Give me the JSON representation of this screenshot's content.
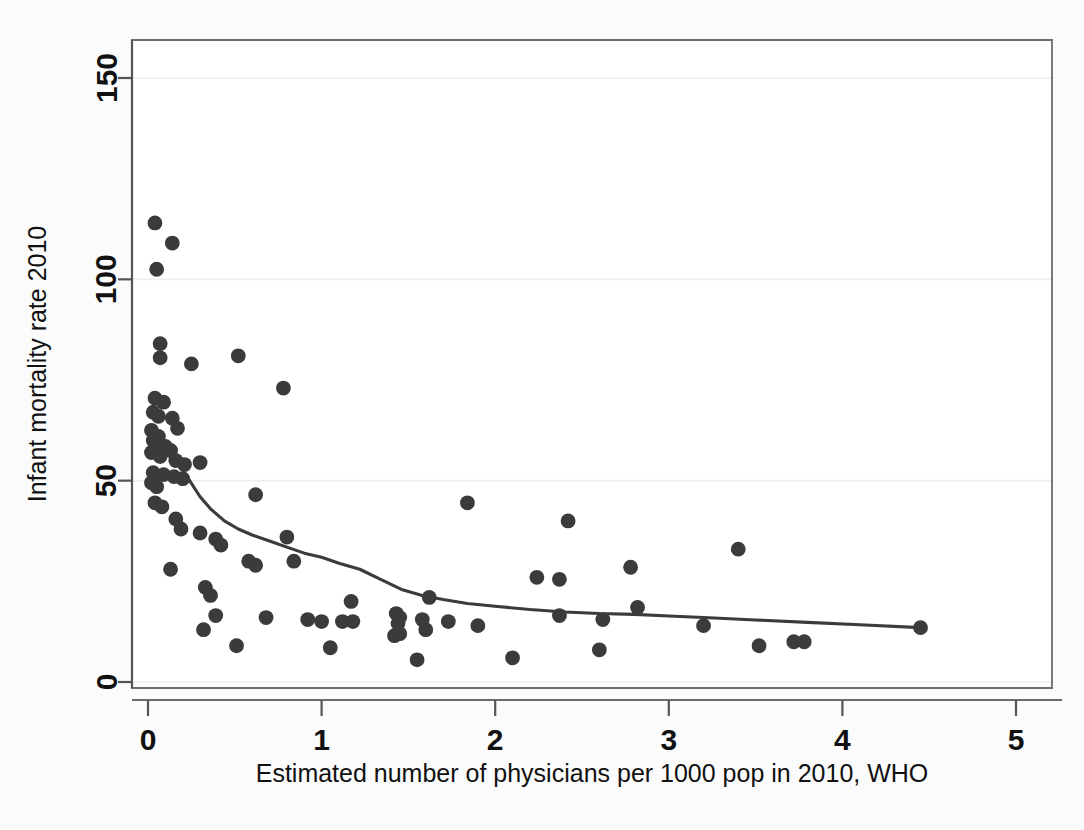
{
  "chart_data": {
    "type": "scatter",
    "title": "",
    "xlabel": "Estimated number of physicians per 1000 pop in 2010, WHO",
    "ylabel": "Infant mortality rate 2010",
    "xlim": [
      0,
      5
    ],
    "ylim": [
      0,
      150
    ],
    "xticks": [
      0,
      1,
      2,
      3,
      4,
      5
    ],
    "yticks": [
      0,
      50,
      100,
      150
    ],
    "xtick_labels": [
      "0",
      "1",
      "2",
      "3",
      "4",
      "5"
    ],
    "ytick_labels": [
      "0",
      "50",
      "100",
      "150"
    ],
    "grid": "horizontal-light",
    "legend": "none",
    "marker_color": "#3b3b3b",
    "line_color": "#3b3b3b",
    "background_color": "#fbfbfb",
    "plot_background_color": "#ffffff",
    "series": [
      {
        "name": "Countries",
        "marker": "filled-circle",
        "points": [
          [
            0.04,
            114.0
          ],
          [
            0.14,
            109.0
          ],
          [
            0.05,
            102.5
          ],
          [
            0.07,
            84.0
          ],
          [
            0.07,
            80.5
          ],
          [
            0.25,
            79.0
          ],
          [
            0.52,
            81.0
          ],
          [
            0.78,
            73.0
          ],
          [
            0.04,
            70.5
          ],
          [
            0.09,
            69.5
          ],
          [
            0.03,
            67.0
          ],
          [
            0.06,
            66.0
          ],
          [
            0.14,
            65.5
          ],
          [
            0.17,
            63.0
          ],
          [
            0.02,
            62.5
          ],
          [
            0.06,
            61.0
          ],
          [
            0.03,
            60.0
          ],
          [
            0.05,
            59.0
          ],
          [
            0.1,
            58.5
          ],
          [
            0.13,
            57.5
          ],
          [
            0.02,
            57.0
          ],
          [
            0.07,
            56.0
          ],
          [
            0.16,
            55.0
          ],
          [
            0.21,
            54.0
          ],
          [
            0.3,
            54.5
          ],
          [
            0.03,
            52.0
          ],
          [
            0.09,
            51.5
          ],
          [
            0.15,
            51.0
          ],
          [
            0.2,
            50.5
          ],
          [
            0.02,
            49.5
          ],
          [
            0.05,
            48.5
          ],
          [
            0.04,
            44.5
          ],
          [
            0.08,
            43.5
          ],
          [
            0.16,
            40.5
          ],
          [
            0.19,
            38.0
          ],
          [
            0.3,
            37.0
          ],
          [
            0.39,
            35.5
          ],
          [
            0.13,
            28.0
          ],
          [
            0.42,
            34.0
          ],
          [
            0.62,
            46.5
          ],
          [
            0.8,
            36.0
          ],
          [
            0.58,
            30.0
          ],
          [
            0.62,
            29.0
          ],
          [
            0.33,
            23.5
          ],
          [
            0.36,
            21.5
          ],
          [
            0.39,
            16.5
          ],
          [
            0.32,
            13.0
          ],
          [
            0.51,
            9.0
          ],
          [
            0.68,
            16.0
          ],
          [
            0.84,
            30.0
          ],
          [
            0.92,
            15.5
          ],
          [
            1.0,
            15.0
          ],
          [
            1.05,
            8.5
          ],
          [
            1.12,
            15.0
          ],
          [
            1.18,
            15.0
          ],
          [
            1.17,
            20.0
          ],
          [
            1.43,
            17.0
          ],
          [
            1.45,
            16.0
          ],
          [
            1.44,
            14.5
          ],
          [
            1.45,
            12.0
          ],
          [
            1.42,
            11.5
          ],
          [
            1.58,
            15.5
          ],
          [
            1.6,
            13.0
          ],
          [
            1.62,
            21.0
          ],
          [
            1.84,
            44.5
          ],
          [
            1.73,
            15.0
          ],
          [
            1.9,
            14.0
          ],
          [
            2.1,
            6.0
          ],
          [
            1.55,
            5.5
          ],
          [
            2.24,
            26.0
          ],
          [
            2.37,
            25.5
          ],
          [
            2.42,
            40.0
          ],
          [
            2.37,
            16.5
          ],
          [
            2.6,
            8.0
          ],
          [
            2.62,
            15.5
          ],
          [
            2.78,
            28.5
          ],
          [
            2.82,
            18.5
          ],
          [
            3.2,
            14.0
          ],
          [
            3.4,
            33.0
          ],
          [
            3.52,
            9.0
          ],
          [
            3.72,
            10.0
          ],
          [
            3.78,
            10.0
          ],
          [
            4.45,
            13.5
          ]
        ]
      }
    ],
    "lowess_curve": {
      "name": "lowess smoother",
      "points": [
        [
          0.06,
          62.0
        ],
        [
          0.12,
          58.0
        ],
        [
          0.18,
          54.0
        ],
        [
          0.24,
          50.0
        ],
        [
          0.3,
          46.0
        ],
        [
          0.36,
          43.0
        ],
        [
          0.44,
          40.0
        ],
        [
          0.52,
          38.0
        ],
        [
          0.6,
          36.5
        ],
        [
          0.7,
          35.0
        ],
        [
          0.8,
          33.5
        ],
        [
          0.9,
          32.0
        ],
        [
          1.0,
          31.0
        ],
        [
          1.1,
          29.5
        ],
        [
          1.22,
          28.0
        ],
        [
          1.34,
          25.5
        ],
        [
          1.46,
          23.0
        ],
        [
          1.58,
          21.5
        ],
        [
          1.7,
          20.5
        ],
        [
          1.84,
          19.5
        ],
        [
          2.0,
          18.8
        ],
        [
          2.2,
          18.0
        ],
        [
          2.4,
          17.4
        ],
        [
          2.6,
          17.0
        ],
        [
          2.8,
          16.8
        ],
        [
          3.0,
          16.4
        ],
        [
          3.2,
          16.0
        ],
        [
          3.5,
          15.4
        ],
        [
          3.8,
          14.8
        ],
        [
          4.1,
          14.2
        ],
        [
          4.45,
          13.5
        ]
      ]
    }
  }
}
